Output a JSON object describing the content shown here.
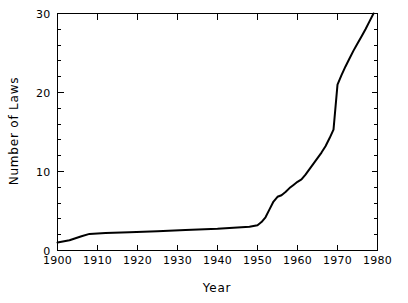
{
  "chart_data": {
    "type": "line",
    "title": "",
    "xlabel": "Year",
    "ylabel": "Number of Laws",
    "xlim": [
      1900,
      1980
    ],
    "ylim": [
      0,
      30
    ],
    "grid": false,
    "legend": null,
    "x_ticks": [
      1900,
      1910,
      1920,
      1930,
      1940,
      1950,
      1960,
      1970,
      1980
    ],
    "x_tick_labels": [
      "1900",
      "1910",
      "1920",
      "1930",
      "1940",
      "1950",
      "1960",
      "1970",
      "1980"
    ],
    "y_ticks": [
      0,
      10,
      20,
      30
    ],
    "y_tick_labels": [
      "0",
      "10",
      "20",
      "30"
    ],
    "y_minor_tick_step": 2,
    "x_minor_tick_step": 10,
    "line_color": "#000000",
    "background_color": "#ffffff",
    "frame": "box",
    "series": [
      {
        "name": "Number of Laws",
        "x": [
          1900,
          1903,
          1906,
          1908,
          1912,
          1918,
          1925,
          1932,
          1940,
          1946,
          1948,
          1950,
          1951,
          1952,
          1953,
          1954,
          1955,
          1956,
          1957,
          1958,
          1959,
          1960,
          1961,
          1962,
          1963,
          1964,
          1965,
          1966,
          1967,
          1968,
          1969,
          1970,
          1971,
          1972,
          1973,
          1974,
          1975,
          1976,
          1977,
          1978,
          1979
        ],
        "y": [
          1.0,
          1.3,
          1.8,
          2.1,
          2.2,
          2.3,
          2.45,
          2.6,
          2.75,
          2.95,
          3.0,
          3.2,
          3.6,
          4.2,
          5.2,
          6.2,
          6.8,
          7.0,
          7.4,
          7.9,
          8.3,
          8.7,
          9.0,
          9.6,
          10.3,
          11.0,
          11.7,
          12.4,
          13.2,
          14.2,
          15.3,
          21.0,
          22.2,
          23.3,
          24.3,
          25.3,
          26.2,
          27.1,
          28.0,
          29.0,
          30.0
        ]
      }
    ]
  },
  "labels": {
    "x_axis_title": "Year",
    "y_axis_title": "Number of Laws"
  }
}
